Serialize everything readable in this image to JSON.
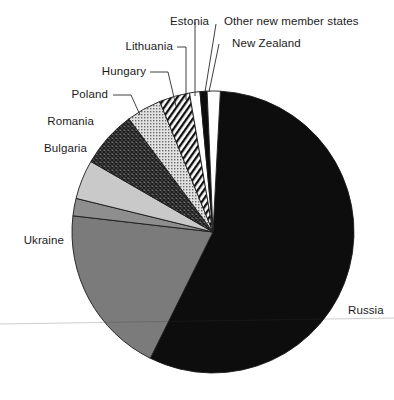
{
  "chart_data": {
    "type": "pie",
    "title": "",
    "subtitle": "",
    "xlabel": "",
    "ylabel": "",
    "legend_position": "none",
    "labels_inline": true,
    "grid": false,
    "categories": [
      "Russia",
      "Ukraine",
      "Bulgaria",
      "Romania",
      "Poland",
      "Hungary",
      "Lithuania",
      "Estonia",
      "Other new member states",
      "New Zealand"
    ],
    "values": [
      56.5,
      19.5,
      2.0,
      4.5,
      6.5,
      4.0,
      3.5,
      1.2,
      0.8,
      1.5
    ],
    "units": "percent",
    "slices": [
      {
        "label": "Russia",
        "value": 56.5,
        "fill": "black",
        "start_deg": 3.0,
        "end_deg": 206.4
      },
      {
        "label": "Ukraine",
        "value": 19.5,
        "fill": "mid-gray",
        "start_deg": 206.4,
        "end_deg": 276.6
      },
      {
        "label": "Bulgaria",
        "value": 2.0,
        "fill": "gray",
        "start_deg": 276.6,
        "end_deg": 283.8
      },
      {
        "label": "Romania",
        "value": 4.5,
        "fill": "light-gray",
        "start_deg": 283.8,
        "end_deg": 300.0
      },
      {
        "label": "Poland",
        "value": 6.5,
        "fill": "crosshatch-dark",
        "start_deg": 300.0,
        "end_deg": 323.4
      },
      {
        "label": "Hungary",
        "value": 4.0,
        "fill": "dots-light",
        "start_deg": 323.4,
        "end_deg": 337.8
      },
      {
        "label": "Lithuania",
        "value": 3.5,
        "fill": "diagonal-stripes",
        "start_deg": 337.8,
        "end_deg": 350.4
      },
      {
        "label": "Estonia",
        "value": 1.2,
        "fill": "white",
        "start_deg": 350.4,
        "end_deg": 354.7
      },
      {
        "label": "Other new member states",
        "value": 0.8,
        "fill": "black",
        "start_deg": 354.7,
        "end_deg": 357.6
      },
      {
        "label": "New Zealand",
        "value": 1.5,
        "fill": "white",
        "start_deg": 357.6,
        "end_deg": 363.0
      }
    ],
    "geometry": {
      "center_x": 213,
      "center_y": 232,
      "radius": 141
    },
    "colors": {
      "black": "#0d0d0d",
      "mid_gray": "#7b7b7b",
      "gray": "#8e8e8e",
      "light_gray": "#c9c9c9",
      "white": "#ffffff",
      "outline": "#1a1a1a"
    }
  },
  "labels": {
    "russia": "Russia",
    "ukraine": "Ukraine",
    "bulgaria": "Bulgaria",
    "romania": "Romania",
    "poland": "Poland",
    "hungary": "Hungary",
    "lithuania": "Lithuania",
    "estonia": "Estonia",
    "other_new_member_states": "Other new member states",
    "new_zealand": "New Zealand"
  }
}
